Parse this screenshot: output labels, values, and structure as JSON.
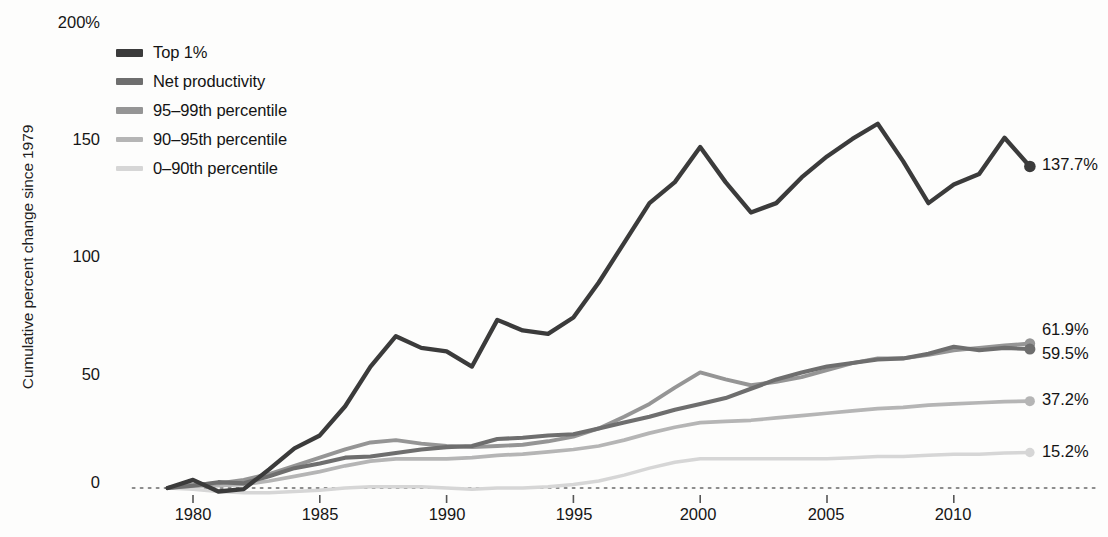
{
  "chart_data": {
    "type": "line",
    "title": "",
    "subtitle": "",
    "xlabel": "",
    "ylabel": "Cumulative percent change since 1979",
    "xlim": [
      1979,
      2013
    ],
    "ylim": [
      0,
      200
    ],
    "y_ticks": [
      "0",
      "50",
      "100",
      "150",
      "200%"
    ],
    "y_tick_values": [
      0,
      50,
      100,
      150,
      200
    ],
    "x_ticks": [
      "1980",
      "1985",
      "1990",
      "1995",
      "2000",
      "2005",
      "2010"
    ],
    "x_tick_values": [
      1980,
      1985,
      1990,
      1995,
      2000,
      2005,
      2010
    ],
    "grid": false,
    "zero_line": true,
    "legend_position": "top-left",
    "x": [
      1979,
      1980,
      1981,
      1982,
      1983,
      1984,
      1985,
      1986,
      1987,
      1988,
      1989,
      1990,
      1991,
      1992,
      1993,
      1994,
      1995,
      1996,
      1997,
      1998,
      1999,
      2000,
      2001,
      2002,
      2003,
      2004,
      2005,
      2006,
      2007,
      2008,
      2009,
      2010,
      2011,
      2012,
      2013
    ],
    "series": [
      {
        "name": "Top 1%",
        "color": "#3b3b3b",
        "end_label": "137.7%",
        "end_value": 137.7,
        "values": [
          0,
          3.5,
          -1.5,
          -0.5,
          8.0,
          17.0,
          22.5,
          35.0,
          52.0,
          65.0,
          60.0,
          58.5,
          52.0,
          72.0,
          67.5,
          66.0,
          73.0,
          88.0,
          105.0,
          122.0,
          131.0,
          146.0,
          131.0,
          118.0,
          122.0,
          133.0,
          142.0,
          149.5,
          156.0,
          140.0,
          122.0,
          130.0,
          134.5,
          150.0,
          137.7
        ]
      },
      {
        "name": "Net productivity",
        "color": "#6e6e6e",
        "end_label": "59.5%",
        "end_value": 59.5,
        "values": [
          0,
          1.0,
          2.5,
          2.0,
          5.0,
          8.5,
          10.5,
          13.0,
          13.5,
          15.0,
          16.5,
          17.5,
          18.0,
          21.0,
          21.5,
          22.5,
          23.0,
          25.5,
          28.0,
          30.5,
          33.5,
          36.0,
          38.5,
          42.5,
          46.5,
          49.5,
          52.0,
          53.5,
          55.0,
          55.5,
          57.5,
          60.5,
          59.0,
          60.0,
          59.5
        ]
      },
      {
        "name": "95–99th percentile",
        "color": "#959595",
        "end_label": "61.9%",
        "end_value": 61.9,
        "values": [
          0,
          1.5,
          2.0,
          3.5,
          6.0,
          9.5,
          13.0,
          16.5,
          19.5,
          20.5,
          19.0,
          18.0,
          17.5,
          18.0,
          18.5,
          20.0,
          22.0,
          25.5,
          30.5,
          36.0,
          43.0,
          49.5,
          46.5,
          44.0,
          45.5,
          47.5,
          50.5,
          53.5,
          55.5,
          55.5,
          57.0,
          59.0,
          60.0,
          61.0,
          61.9
        ]
      },
      {
        "name": "90–95th percentile",
        "color": "#b5b5b5",
        "end_label": "37.2%",
        "end_value": 37.2,
        "values": [
          0,
          0.8,
          1.0,
          1.5,
          3.0,
          5.0,
          7.0,
          9.5,
          11.5,
          12.5,
          12.5,
          12.5,
          13.0,
          14.0,
          14.5,
          15.5,
          16.5,
          18.0,
          20.5,
          23.5,
          26.0,
          28.0,
          28.5,
          29.0,
          30.0,
          31.0,
          32.0,
          33.0,
          34.0,
          34.5,
          35.5,
          36.0,
          36.5,
          37.0,
          37.2
        ]
      },
      {
        "name": "0–90th percentile",
        "color": "#d6d6d6",
        "end_label": "15.2%",
        "end_value": 15.2,
        "values": [
          0,
          -0.5,
          -1.5,
          -2.0,
          -2.0,
          -1.5,
          -1.0,
          0.0,
          0.5,
          0.5,
          0.5,
          0.0,
          -0.5,
          0.0,
          0.0,
          0.5,
          1.5,
          3.0,
          5.5,
          8.5,
          11.0,
          12.5,
          12.5,
          12.5,
          12.5,
          12.5,
          12.5,
          13.0,
          13.5,
          13.5,
          14.0,
          14.5,
          14.5,
          15.0,
          15.2
        ]
      }
    ]
  },
  "legend": {
    "items": [
      {
        "label": "Top 1%",
        "color": "#3b3b3b"
      },
      {
        "label": "Net productivity",
        "color": "#6e6e6e"
      },
      {
        "label": "95–99th percentile",
        "color": "#959595"
      },
      {
        "label": "90–95th percentile",
        "color": "#b5b5b5"
      },
      {
        "label": "0–90th percentile",
        "color": "#d6d6d6"
      }
    ]
  },
  "axis": {
    "y_title": "Cumulative percent change since 1979",
    "y_labels": [
      "200%",
      "150",
      "100",
      "50",
      "0"
    ],
    "x_labels": [
      "1980",
      "1985",
      "1990",
      "1995",
      "2000",
      "2005",
      "2010"
    ]
  },
  "end_labels": [
    {
      "text": "137.7%",
      "series": "Top 1%"
    },
    {
      "text": "61.9%",
      "series": "95–99th percentile"
    },
    {
      "text": "59.5%",
      "series": "Net productivity"
    },
    {
      "text": "37.2%",
      "series": "90–95th percentile"
    },
    {
      "text": "15.2%",
      "series": "0–90th percentile"
    }
  ]
}
